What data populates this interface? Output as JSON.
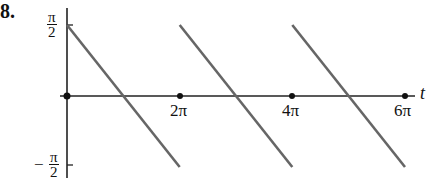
{
  "problem": {
    "number_label": "8."
  },
  "chart_data": {
    "type": "line",
    "title": "",
    "xlabel": "t",
    "ylabel": "",
    "x_ticks": [
      {
        "value": 6.283,
        "label": "2π"
      },
      {
        "value": 12.566,
        "label": "4π"
      },
      {
        "value": 18.85,
        "label": "6π"
      }
    ],
    "y_ticks": [
      {
        "value": 1.5708,
        "label": "π/2"
      },
      {
        "value": -1.5708,
        "label": "-π/2"
      }
    ],
    "xlim": [
      0,
      19.5
    ],
    "ylim": [
      -1.5708,
      1.5708
    ],
    "grid": false,
    "legend": null,
    "series": [
      {
        "name": "sawtooth segment 1",
        "x": [
          0,
          6.283
        ],
        "y": [
          1.5708,
          -1.5708
        ]
      },
      {
        "name": "sawtooth segment 2",
        "x": [
          6.283,
          12.566
        ],
        "y": [
          1.5708,
          -1.5708
        ]
      },
      {
        "name": "sawtooth segment 3",
        "x": [
          12.566,
          18.85
        ],
        "y": [
          1.5708,
          -1.5708
        ]
      }
    ],
    "line_color": "#666666",
    "axis_color": "#222222"
  },
  "labels": {
    "y_top_num": "π",
    "y_top_den": "2",
    "y_bot_sign": "−",
    "y_bot_num": "π",
    "y_bot_den": "2",
    "x_tick_1": "2π",
    "x_tick_2": "4π",
    "x_tick_3": "6π",
    "x_axis_var": "t"
  }
}
